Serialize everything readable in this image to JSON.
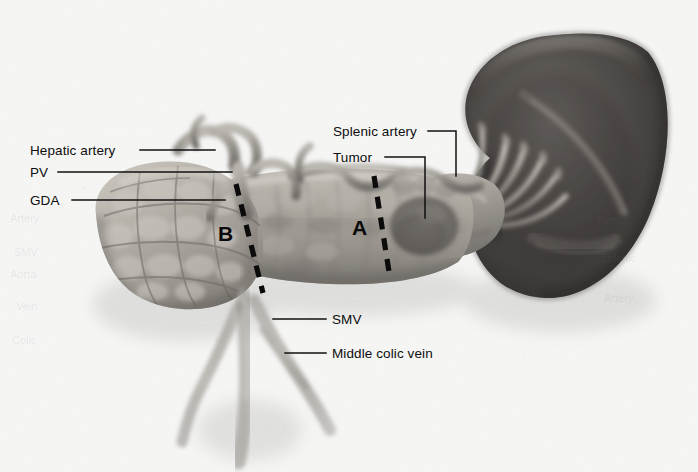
{
  "figure": {
    "background_color": "#f7f7f6",
    "width": 698,
    "height": 472
  },
  "labels": [
    {
      "id": "hepatic-artery",
      "text": "Hepatic artery",
      "text_x": 30,
      "text_y": 143,
      "leader": "M 140 150 L 215 150",
      "anchor": "left"
    },
    {
      "id": "pv",
      "text": "PV",
      "text_x": 30,
      "text_y": 165,
      "leader": "M 58 172 L 232 172",
      "anchor": "left"
    },
    {
      "id": "gda",
      "text": "GDA",
      "text_x": 30,
      "text_y": 193,
      "leader": "M 72 200 L 225 200",
      "anchor": "left"
    },
    {
      "id": "splenic-artery",
      "text": "Splenic artery",
      "text_x": 333,
      "text_y": 124,
      "leader": "M 428 131 L 456 131 L 456 176",
      "anchor": "right"
    },
    {
      "id": "tumor",
      "text": "Tumor",
      "text_x": 333,
      "text_y": 150,
      "leader": "M 385 157 L 425 157 L 425 218",
      "anchor": "right"
    },
    {
      "id": "smv",
      "text": "SMV",
      "text_x": 332,
      "text_y": 312,
      "leader": "M 273 319 L 326 319",
      "anchor": "bottom"
    },
    {
      "id": "middle-colic-vein",
      "text": "Middle colic vein",
      "text_x": 332,
      "text_y": 346,
      "leader": "M 285 353 L 326 353",
      "anchor": "bottom"
    }
  ],
  "transection_lines": [
    {
      "id": "line-b",
      "letter": "B",
      "letter_x": 218,
      "letter_y": 222,
      "path": "M 236 184 L 263 293",
      "style": "dashed"
    },
    {
      "id": "line-a",
      "letter": "A",
      "letter_x": 352,
      "letter_y": 216,
      "path": "M 374 176 L 390 278",
      "style": "dashed"
    }
  ],
  "anatomy": [
    {
      "id": "spleen",
      "name": "spleen",
      "tone": "#4a4a4a"
    },
    {
      "id": "pancreas-head",
      "name": "pancreatic head",
      "tone": "#a8a49d"
    },
    {
      "id": "pancreas-body",
      "name": "pancreatic body",
      "tone": "#9e9a94"
    },
    {
      "id": "pancreas-tail",
      "name": "pancreatic tail",
      "tone": "#8f8b86"
    },
    {
      "id": "tumor-mass",
      "name": "tumor mass in pancreatic body",
      "tone": "#6e6a66"
    },
    {
      "id": "hepatic-artery-vessel",
      "name": "hepatic artery",
      "tone": "#8b8782"
    },
    {
      "id": "portal-vein-vessel",
      "name": "portal vein",
      "tone": "#959089"
    },
    {
      "id": "gda-vessel",
      "name": "gastroduodenal artery",
      "tone": "#8d8984"
    },
    {
      "id": "splenic-artery-vessel",
      "name": "splenic artery",
      "tone": "#8a8681"
    },
    {
      "id": "smv-vessel",
      "name": "superior mesenteric vein",
      "tone": "#a3a09a"
    },
    {
      "id": "middle-colic-vein-vessel",
      "name": "middle colic vein",
      "tone": "#a6a29c"
    },
    {
      "id": "splenic-hilum-vessels",
      "name": "splenic hilar vessels",
      "tone": "#b4b0aa"
    }
  ],
  "showthrough": [
    {
      "text": "Artery",
      "x": 10,
      "y": 212
    },
    {
      "text": "SMV",
      "x": 14,
      "y": 246
    },
    {
      "text": "Aorta",
      "x": 10,
      "y": 268
    },
    {
      "text": "Vein",
      "x": 16,
      "y": 300
    },
    {
      "text": "Colic",
      "x": 12,
      "y": 334
    },
    {
      "text": "Tumor",
      "x": 596,
      "y": 214
    },
    {
      "text": "Splenic",
      "x": 600,
      "y": 252
    },
    {
      "text": "Artery",
      "x": 604,
      "y": 292
    }
  ]
}
